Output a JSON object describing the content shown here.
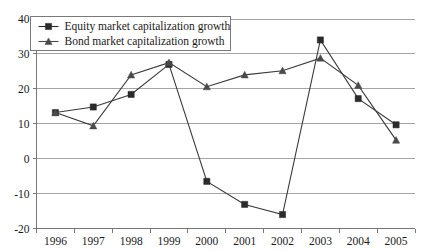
{
  "chart_data": {
    "type": "line",
    "title": "",
    "subtitle": "",
    "xlabel": "",
    "ylabel": "",
    "categories": [
      "1996",
      "1997",
      "1998",
      "1999",
      "2000",
      "2001",
      "2002",
      "2003",
      "2004",
      "2005"
    ],
    "series": [
      {
        "name": "Equity market capitalization growth",
        "marker": "square",
        "color": "#2b2b2b",
        "values": [
          13.2,
          14.8,
          18.4,
          27.0,
          -6.5,
          -13.1,
          -16.0,
          34.0,
          17.2,
          9.7
        ]
      },
      {
        "name": "Bond market capitalization growth",
        "marker": "triangle",
        "color": "#4a4a4a",
        "values": [
          13.2,
          9.4,
          24.0,
          27.5,
          20.6,
          24.0,
          25.2,
          28.8,
          21.0,
          5.3
        ]
      }
    ],
    "ylim": [
      -20,
      40
    ],
    "ytick_values": [
      40,
      30,
      20,
      10,
      0,
      -10,
      -20
    ],
    "ytick_labels": [
      "40",
      "30",
      "20",
      "10",
      "0",
      "-10",
      "-20"
    ],
    "xlim_categories": [
      "1996",
      "2005"
    ],
    "grid": "horizontal",
    "legend_position": "top-left",
    "legend_entries": [
      "Equity market capitalization growth",
      "Bond market capitalization growth"
    ]
  },
  "axes": {
    "y_ticks": [
      "40",
      "30",
      "20",
      "10",
      "0",
      "-10",
      "-20"
    ],
    "x_ticks": [
      "1996",
      "1997",
      "1998",
      "1999",
      "2000",
      "2001",
      "2002",
      "2003",
      "2004",
      "2005"
    ]
  },
  "legend": {
    "items": [
      {
        "label": "Equity market capitalization growth",
        "marker": "square-marker-icon"
      },
      {
        "label": "Bond market capitalization growth",
        "marker": "triangle-marker-icon"
      }
    ]
  },
  "colors": {
    "equity_series": "#2b2b2b",
    "bond_series": "#4a4a4a",
    "gridline": "#9a9a9a",
    "axis": "#777777",
    "text": "#1a1a1a",
    "background": "#ffffff"
  }
}
